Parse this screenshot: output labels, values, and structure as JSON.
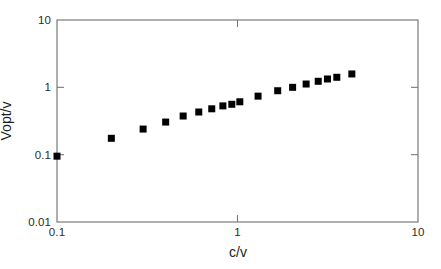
{
  "chart_data": {
    "type": "scatter",
    "title": "",
    "xlabel": "c/v",
    "ylabel": "Vopt/v",
    "xscale": "log",
    "yscale": "log",
    "xlim": [
      0.1,
      10
    ],
    "ylim": [
      0.01,
      10
    ],
    "xticks": [
      "0.1",
      "1",
      "10"
    ],
    "xtick_values": [
      0.1,
      1,
      10
    ],
    "yticks": [
      "10",
      "1",
      "0.1",
      "0.01"
    ],
    "ytick_values": [
      10,
      1,
      0.1,
      0.01
    ],
    "grid": false,
    "legend": null,
    "marker": "square",
    "marker_color": "#000000",
    "frame_color": "#7a7a7a",
    "series": [
      {
        "name": "Vopt/v vs c/v",
        "x": [
          0.1,
          0.2,
          0.3,
          0.4,
          0.5,
          0.61,
          0.72,
          0.83,
          0.93,
          1.03,
          1.3,
          1.67,
          2.02,
          2.4,
          2.8,
          3.15,
          3.55,
          4.3
        ],
        "y": [
          0.095,
          0.175,
          0.24,
          0.305,
          0.375,
          0.43,
          0.48,
          0.53,
          0.56,
          0.61,
          0.74,
          0.89,
          1.0,
          1.12,
          1.23,
          1.33,
          1.41,
          1.58
        ]
      }
    ]
  },
  "axes": {
    "x_tick_labels": [
      {
        "text": "0.1",
        "value": 0.1
      },
      {
        "text": "1",
        "value": 1
      },
      {
        "text": "10",
        "value": 10
      }
    ],
    "y_tick_labels": [
      {
        "text": "10",
        "value": 10
      },
      {
        "text": "1",
        "value": 1
      },
      {
        "text": "0.1",
        "value": 0.1
      },
      {
        "text": "0.01",
        "value": 0.01
      }
    ]
  }
}
